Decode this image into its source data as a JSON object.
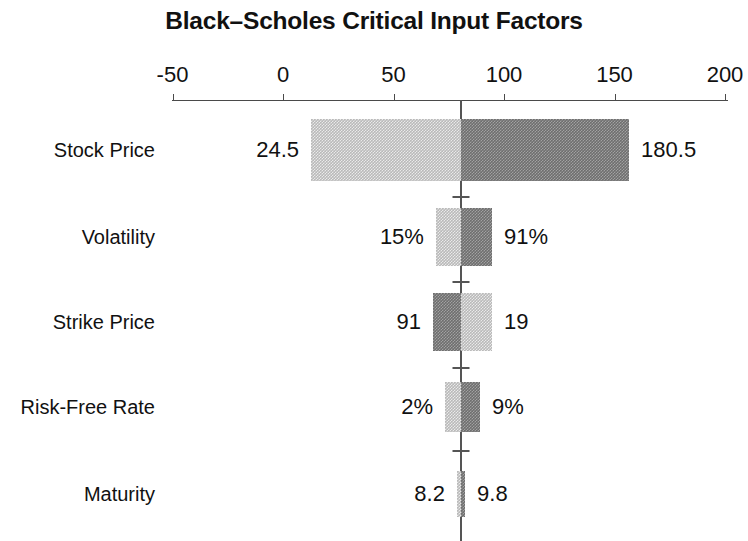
{
  "chart_data": {
    "type": "bar",
    "subtype": "tornado",
    "title": "Black–Scholes Critical Input Factors",
    "xlabel": "",
    "ylabel": "",
    "orientation": "horizontal",
    "grid": false,
    "legend": false,
    "xlim": [
      -50,
      200
    ],
    "xticks": [
      -50,
      0,
      50,
      100,
      150,
      200
    ],
    "xtick_labels": [
      "-50",
      "0",
      "50",
      "100",
      "150",
      "200"
    ],
    "base_case_value": 80.5,
    "categories": [
      "Stock Price",
      "Volatility",
      "Strike Price",
      "Risk-Free Rate",
      "Maturity"
    ],
    "bars": [
      {
        "category": "Stock Price",
        "low_label": "24.5",
        "high_label": "180.5",
        "bar_start": 12.7,
        "bar_end": 156.6,
        "left_segment_shade": "light",
        "right_segment_shade": "dark"
      },
      {
        "category": "Volatility",
        "low_label": "15%",
        "high_label": "91%",
        "bar_start": 69.2,
        "bar_end": 94.6,
        "left_segment_shade": "light",
        "right_segment_shade": "dark"
      },
      {
        "category": "Strike Price",
        "low_label": "91",
        "high_label": "19",
        "bar_start": 67.9,
        "bar_end": 94.6,
        "left_segment_shade": "dark",
        "right_segment_shade": "light"
      },
      {
        "category": "Risk-Free Rate",
        "low_label": "2%",
        "high_label": "9%",
        "bar_start": 73.3,
        "bar_end": 89.1,
        "left_segment_shade": "light",
        "right_segment_shade": "dark"
      },
      {
        "category": "Maturity",
        "low_label": "8.2",
        "high_label": "9.8",
        "bar_start": 78.7,
        "bar_end": 82.4,
        "left_segment_shade": "light",
        "right_segment_shade": "dark"
      }
    ],
    "colors": {
      "light_shade": "#b9b9b9",
      "dark_shade": "#6e6e6e",
      "axis": "#555555",
      "text": "#111111",
      "background": "#ffffff"
    }
  }
}
